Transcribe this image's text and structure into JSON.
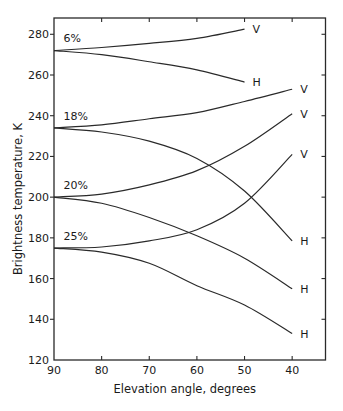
{
  "chart_data": {
    "type": "line",
    "title": "",
    "xlabel": "Elevation angle, degrees",
    "ylabel": "Brightness temperature, K",
    "xlim": [
      90,
      33
    ],
    "ylim": [
      120,
      288
    ],
    "x_ticks": [
      90,
      80,
      70,
      60,
      50,
      40
    ],
    "y_ticks": [
      120,
      140,
      160,
      180,
      200,
      220,
      240,
      260,
      280
    ],
    "grid": false,
    "legend": "inline labels",
    "groups": [
      {
        "label": "6%",
        "label_pos": {
          "x": 88,
          "y": 276
        }
      },
      {
        "label": "18%",
        "label_pos": {
          "x": 88,
          "y": 238
        }
      },
      {
        "label": "20%",
        "label_pos": {
          "x": 88,
          "y": 204
        }
      },
      {
        "label": "25%",
        "label_pos": {
          "x": 88,
          "y": 179
        }
      }
    ],
    "series": [
      {
        "name": "6% V",
        "group": "6%",
        "polarization": "V",
        "end_label": "V",
        "x": [
          90,
          80,
          70,
          60,
          50
        ],
        "y": [
          272,
          273.5,
          275.5,
          278,
          282.5
        ]
      },
      {
        "name": "6% H",
        "group": "6%",
        "polarization": "H",
        "end_label": "H",
        "x": [
          90,
          80,
          70,
          60,
          50
        ],
        "y": [
          272,
          270,
          266.5,
          262.5,
          256.5
        ]
      },
      {
        "name": "18% V",
        "group": "18%",
        "polarization": "V",
        "end_label": "V",
        "x": [
          90,
          80,
          70,
          60,
          50,
          40
        ],
        "y": [
          234,
          235.5,
          238.5,
          241.5,
          247,
          253
        ]
      },
      {
        "name": "18% H",
        "group": "18%",
        "polarization": "H",
        "end_label": "H",
        "x": [
          90,
          80,
          70,
          60,
          50,
          40
        ],
        "y": [
          234,
          232,
          227.5,
          219,
          203,
          178.5
        ]
      },
      {
        "name": "20% V",
        "group": "20%",
        "polarization": "V",
        "end_label": "V",
        "x": [
          90,
          80,
          70,
          60,
          50,
          40
        ],
        "y": [
          200,
          201.5,
          206,
          213,
          225,
          241
        ]
      },
      {
        "name": "20% H",
        "group": "20%",
        "polarization": "H",
        "end_label": "H",
        "x": [
          90,
          80,
          70,
          60,
          50,
          40
        ],
        "y": [
          200,
          197,
          190,
          181,
          170,
          155
        ]
      },
      {
        "name": "25% V",
        "group": "25%",
        "polarization": "V",
        "end_label": "V",
        "x": [
          90,
          80,
          70,
          60,
          50,
          40
        ],
        "y": [
          175,
          175.5,
          178.5,
          184,
          197,
          221
        ]
      },
      {
        "name": "25% H",
        "group": "25%",
        "polarization": "H",
        "end_label": "H",
        "x": [
          90,
          80,
          70,
          60,
          50,
          40
        ],
        "y": [
          175,
          173,
          167.5,
          156.5,
          147,
          133
        ]
      }
    ]
  }
}
